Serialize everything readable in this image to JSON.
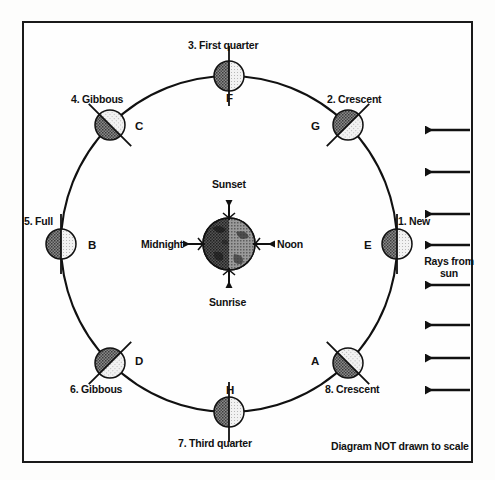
{
  "diagram": {
    "footer_note": "Diagram NOT drawn to scale",
    "sun_rays_label": "Rays from\nsun",
    "sun_rays_label_line1": "Rays from",
    "sun_rays_label_line2": "sun",
    "sun_ray_count": 8,
    "sun_direction": "right-to-left",
    "earth": {
      "name": "Earth",
      "directions": [
        {
          "key": "sunset",
          "label": "Sunset",
          "position": "top"
        },
        {
          "key": "noon",
          "label": "Noon",
          "position": "right"
        },
        {
          "key": "sunrise",
          "label": "Sunrise",
          "position": "bottom"
        },
        {
          "key": "midnight",
          "label": "Midnight",
          "position": "left"
        }
      ]
    },
    "orbit": {
      "center_x": 229,
      "center_y": 244,
      "radius": 168
    },
    "moons": [
      {
        "number": "1",
        "phase": "New",
        "phase_label": "1. New",
        "letter": "E",
        "angle_deg": 0,
        "position": "right",
        "cx": 397,
        "cy": 244,
        "lit_side": "right",
        "terminator": "vertical",
        "phase_label_x": 398,
        "phase_label_y": 215,
        "letter_x": 364,
        "letter_y": 239
      },
      {
        "number": "2",
        "phase": "Crescent",
        "phase_label": "2. Crescent",
        "letter": "G",
        "angle_deg": 45,
        "position": "upper-right",
        "cx": 348,
        "cy": 125,
        "lit_side": "right",
        "terminator": "diagonal-nesw",
        "phase_label_x": 327,
        "phase_label_y": 93,
        "letter_x": 311,
        "letter_y": 120
      },
      {
        "number": "3",
        "phase": "First quarter",
        "phase_label": "3. First quarter",
        "letter": "F",
        "angle_deg": 90,
        "position": "top",
        "cx": 229,
        "cy": 76,
        "lit_side": "right",
        "terminator": "vertical",
        "phase_label_x": 188,
        "phase_label_y": 39,
        "letter_x": 226,
        "letter_y": 92
      },
      {
        "number": "4",
        "phase": "Gibbous",
        "phase_label": "4. Gibbous",
        "letter": "C",
        "angle_deg": 135,
        "position": "upper-left",
        "cx": 110,
        "cy": 125,
        "lit_side": "right",
        "terminator": "diagonal-nwse",
        "phase_label_x": 71,
        "phase_label_y": 93,
        "letter_x": 135,
        "letter_y": 120
      },
      {
        "number": "5",
        "phase": "Full",
        "phase_label": "5. Full",
        "letter": "B",
        "angle_deg": 180,
        "position": "left",
        "cx": 61,
        "cy": 244,
        "lit_side": "right",
        "terminator": "vertical",
        "phase_label_x": 24,
        "phase_label_y": 215,
        "letter_x": 88,
        "letter_y": 239
      },
      {
        "number": "6",
        "phase": "Gibbous",
        "phase_label": "6. Gibbous",
        "letter": "D",
        "angle_deg": 225,
        "position": "lower-left",
        "cx": 110,
        "cy": 363,
        "lit_side": "right",
        "terminator": "diagonal-nesw",
        "phase_label_x": 70,
        "phase_label_y": 383,
        "letter_x": 135,
        "letter_y": 355
      },
      {
        "number": "7",
        "phase": "Third quarter",
        "phase_label": "7. Third quarter",
        "letter": "H",
        "angle_deg": 270,
        "position": "bottom",
        "cx": 229,
        "cy": 412,
        "lit_side": "right",
        "terminator": "vertical",
        "phase_label_x": 178,
        "phase_label_y": 437,
        "letter_x": 226,
        "letter_y": 384
      },
      {
        "number": "8",
        "phase": "Crescent",
        "phase_label": "8. Crescent",
        "letter": "A",
        "angle_deg": 315,
        "position": "lower-right",
        "cx": 348,
        "cy": 363,
        "lit_side": "right",
        "terminator": "diagonal-nwse",
        "phase_label_x": 325,
        "phase_label_y": 383,
        "letter_x": 311,
        "letter_y": 355
      }
    ],
    "colors": {
      "ink": "#111111",
      "moon_dark": "#6f6f6f",
      "moon_light": "#dedede",
      "earth_dark": "#3f3f3f",
      "earth_light": "#7a7a7a",
      "background": "#fefefe"
    }
  }
}
